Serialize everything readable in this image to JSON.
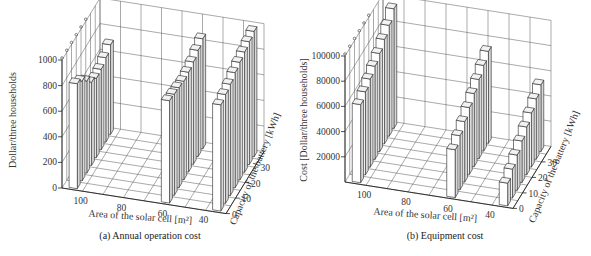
{
  "chart_data": [
    {
      "type": "bar",
      "subtype": "3d-bar",
      "title": "(a) Annual operation cost",
      "xlabel": "Area of the solar cell [m²]",
      "ylabel": "Capacity of the battery [kWh]",
      "zlabel": "Dollar/three households",
      "x_ticks": [
        "100",
        "80",
        "60",
        "40"
      ],
      "y_ticks": [
        "0",
        "10",
        "20",
        "30"
      ],
      "z_ticks": [
        "0",
        "200",
        "400",
        "600",
        "800",
        "1000"
      ],
      "zlim": [
        0,
        1000
      ],
      "series": [
        {
          "name": "Area ≈ 105 m²",
          "battery_kwh": [
            0,
            5,
            10,
            15,
            20,
            25,
            30,
            35
          ],
          "values": [
            820,
            780,
            720,
            650,
            620,
            630,
            660,
            700
          ]
        },
        {
          "name": "Area ≈ 60 m²",
          "battery_kwh": [
            0,
            5,
            10,
            15,
            20,
            25,
            30,
            35
          ],
          "values": [
            800,
            790,
            780,
            770,
            780,
            800,
            830,
            860
          ]
        },
        {
          "name": "Area ≈ 35 m²",
          "battery_kwh": [
            0,
            5,
            10,
            15,
            20,
            25,
            30,
            35
          ],
          "values": [
            830,
            850,
            870,
            900,
            920,
            940,
            960,
            980
          ]
        }
      ],
      "grid": true
    },
    {
      "type": "bar",
      "subtype": "3d-bar",
      "title": "(b) Equipment cost",
      "xlabel": "Area of the solar cell [m²]",
      "ylabel": "Capacity of the battery [kWh]",
      "zlabel": "Cost [Dollar/three households]",
      "x_ticks": [
        "100",
        "80",
        "60",
        "40"
      ],
      "y_ticks": [
        "0",
        "10",
        "20",
        "30"
      ],
      "z_ticks": [
        "20000",
        "40000",
        "60000",
        "80000",
        "100000"
      ],
      "zlim": [
        0,
        100000
      ],
      "series": [
        {
          "name": "Area ≈ 105 m²",
          "battery_kwh": [
            0,
            5,
            10,
            15,
            20,
            25,
            30,
            35
          ],
          "values": [
            62000,
            66000,
            70000,
            74000,
            78000,
            83000,
            88000,
            95000
          ]
        },
        {
          "name": "Area ≈ 60 m²",
          "battery_kwh": [
            0,
            5,
            10,
            15,
            20,
            25,
            30,
            35
          ],
          "values": [
            38000,
            43000,
            48000,
            53000,
            58000,
            63000,
            68000,
            73000
          ]
        },
        {
          "name": "Area ≈ 35 m²",
          "battery_kwh": [
            0,
            5,
            10,
            15,
            20,
            25,
            30,
            35
          ],
          "values": [
            18000,
            23000,
            28000,
            33000,
            38000,
            43000,
            48000,
            53000
          ]
        }
      ],
      "grid": true
    }
  ],
  "panels": {
    "a": {
      "caption": "(a) Annual operation cost",
      "zlabel": "Dollar/three households",
      "xlabel": "Area of the solar cell [m²]",
      "ylabel": "Capacity of the battery [kWh]"
    },
    "b": {
      "caption": "(b) Equipment cost",
      "zlabel": "Cost [Dollar/three households]",
      "xlabel": "Area of the solar cell [m²]",
      "ylabel": "Capacity of the battery [kWh]"
    }
  }
}
